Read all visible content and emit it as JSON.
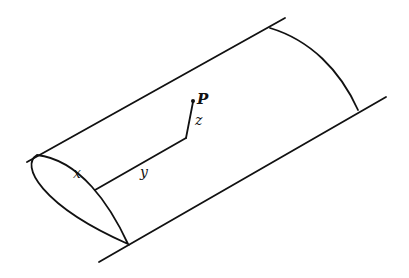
{
  "diagram": {
    "labels": {
      "x": "x",
      "y": "y",
      "z": "z",
      "point": "P"
    },
    "colors": {
      "stroke": "#111111",
      "background": "#ffffff"
    }
  }
}
